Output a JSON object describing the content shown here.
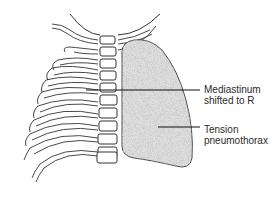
{
  "diagram": {
    "labels": [
      {
        "id": "mediastinum",
        "lines": [
          "Mediastinum",
          "shifted to R"
        ]
      },
      {
        "id": "tension",
        "lines": [
          "Tension",
          "pneumothorax"
        ]
      }
    ],
    "colors": {
      "outline": "#333333",
      "lung_fill": "#d9d9d9",
      "lung_stipple": "#8a8a8a",
      "text": "#2a2a2a",
      "background": "#ffffff"
    }
  }
}
